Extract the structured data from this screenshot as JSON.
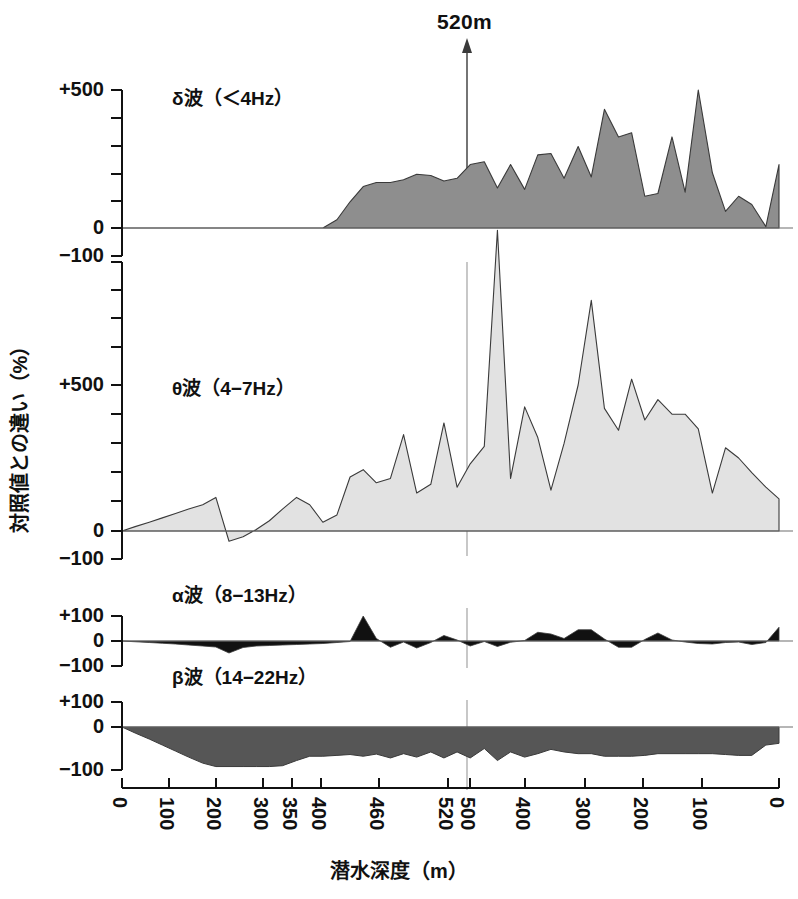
{
  "figure": {
    "depth_marker": {
      "label": "520m",
      "icon": "up-arrow-icon",
      "x_value": 520
    },
    "x_axis_title": "潜水深度（m）",
    "y_axis_title": "対照値との違い（%）",
    "x_tick_labels": [
      "0",
      "100",
      "200",
      "300",
      "350",
      "400",
      "460",
      "520",
      "500",
      "400",
      "300",
      "200",
      "100",
      "0"
    ],
    "colors": {
      "delta_fill": "#8e8e8e",
      "theta_fill": "#e2e2e2",
      "alpha_fill": "#111111",
      "beta_fill": "#565656",
      "axis": "#6f6f6f",
      "stroke": "#3a3a3a"
    }
  },
  "chart_data": [
    {
      "type": "area",
      "name": "delta",
      "title": "δ波（＜4Hz）",
      "xlabel": "潜水深度（m）",
      "ylabel": "対照値との違い（%）",
      "ytick_labels": [
        "+500",
        "0"
      ],
      "ytick_values": [
        500,
        0
      ],
      "ylim": [
        0,
        560
      ],
      "grid": false,
      "x": [
        0,
        14,
        29,
        43,
        57,
        71,
        86,
        100,
        114,
        129,
        143,
        157,
        171,
        186,
        200,
        214,
        229,
        243,
        257,
        271,
        286,
        300,
        314,
        329,
        343,
        357,
        371,
        386,
        400,
        414,
        429,
        443,
        457,
        471,
        486,
        500,
        514,
        529,
        543,
        557,
        571,
        586,
        600,
        614,
        629,
        643,
        657,
        671,
        686,
        700
      ],
      "values": [
        0,
        0,
        0,
        0,
        0,
        0,
        0,
        0,
        0,
        0,
        0,
        0,
        0,
        0,
        0,
        0,
        30,
        95,
        150,
        165,
        165,
        175,
        195,
        190,
        170,
        180,
        230,
        240,
        145,
        230,
        140,
        265,
        270,
        180,
        295,
        185,
        430,
        330,
        345,
        115,
        125,
        330,
        130,
        500,
        200,
        60,
        115,
        85,
        5,
        230
      ]
    },
    {
      "type": "area",
      "name": "theta",
      "title": "θ波（4−7Hz）",
      "xlabel": "潜水深度（m）",
      "ylabel": "対照値との違い（%）",
      "ytick_labels": [
        "−100",
        "+500",
        "0",
        "−100"
      ],
      "ytick_values": [
        -100,
        500,
        0,
        -100
      ],
      "ylim": [
        -100,
        1080
      ],
      "grid": false,
      "x": [
        0,
        14,
        29,
        43,
        57,
        71,
        86,
        100,
        114,
        129,
        143,
        157,
        171,
        186,
        200,
        214,
        229,
        243,
        257,
        271,
        286,
        300,
        314,
        329,
        343,
        357,
        371,
        386,
        400,
        414,
        429,
        443,
        457,
        471,
        486,
        500,
        514,
        529,
        543,
        557,
        571,
        586,
        600,
        614,
        629,
        643,
        657,
        671,
        686,
        700
      ],
      "values": [
        0,
        15,
        30,
        45,
        60,
        75,
        90,
        115,
        -35,
        -20,
        5,
        35,
        75,
        115,
        90,
        30,
        55,
        185,
        210,
        165,
        180,
        330,
        130,
        160,
        370,
        150,
        230,
        290,
        1030,
        180,
        425,
        320,
        140,
        300,
        500,
        790,
        420,
        345,
        520,
        380,
        450,
        400,
        400,
        350,
        130,
        285,
        250,
        200,
        150,
        110
      ]
    },
    {
      "type": "area",
      "name": "alpha",
      "title": "α波（8−13Hz）",
      "xlabel": "潜水深度（m）",
      "ylabel": "対照値との違い（%）",
      "ytick_labels": [
        "+100",
        "0",
        "−100"
      ],
      "ytick_values": [
        100,
        0,
        -100
      ],
      "ylim": [
        -100,
        100
      ],
      "grid": false,
      "x": [
        0,
        14,
        29,
        43,
        57,
        71,
        86,
        100,
        114,
        129,
        143,
        157,
        171,
        186,
        200,
        214,
        229,
        243,
        257,
        271,
        286,
        300,
        314,
        329,
        343,
        357,
        371,
        386,
        400,
        414,
        429,
        443,
        457,
        471,
        486,
        500,
        514,
        529,
        543,
        557,
        571,
        586,
        600,
        614,
        629,
        643,
        657,
        671,
        686,
        700
      ],
      "values": [
        0,
        -3,
        -6,
        -9,
        -12,
        -16,
        -20,
        -24,
        -48,
        -26,
        -20,
        -18,
        -16,
        -14,
        -12,
        -10,
        -6,
        -2,
        100,
        10,
        -25,
        -4,
        -28,
        -6,
        22,
        4,
        -20,
        -2,
        -22,
        -5,
        2,
        35,
        28,
        10,
        45,
        45,
        8,
        -25,
        -25,
        6,
        32,
        4,
        -4,
        -10,
        -12,
        -6,
        -4,
        -14,
        -6,
        55
      ]
    },
    {
      "type": "area",
      "name": "beta",
      "title": "β波（14−22Hz）",
      "xlabel": "潜水深度（m）",
      "ylabel": "対照値との違い（%）",
      "ytick_labels": [
        "+100",
        "0",
        "−100"
      ],
      "ytick_values": [
        100,
        0,
        -100
      ],
      "ylim": [
        -100,
        100
      ],
      "grid": false,
      "x": [
        0,
        14,
        29,
        43,
        57,
        71,
        86,
        100,
        114,
        129,
        143,
        157,
        171,
        186,
        200,
        214,
        229,
        243,
        257,
        271,
        286,
        300,
        314,
        329,
        343,
        357,
        371,
        386,
        400,
        414,
        429,
        443,
        457,
        471,
        486,
        500,
        514,
        529,
        543,
        557,
        571,
        586,
        600,
        614,
        629,
        643,
        657,
        671,
        686,
        700
      ],
      "values": [
        0,
        -14,
        -28,
        -42,
        -56,
        -70,
        -84,
        -92,
        -92,
        -92,
        -92,
        -92,
        -90,
        -78,
        -68,
        -68,
        -66,
        -64,
        -68,
        -63,
        -72,
        -62,
        -70,
        -58,
        -72,
        -58,
        -72,
        -50,
        -78,
        -58,
        -70,
        -62,
        -52,
        -58,
        -62,
        -62,
        -68,
        -68,
        -68,
        -66,
        -62,
        -62,
        -62,
        -62,
        -62,
        -64,
        -66,
        -66,
        -42,
        -38
      ]
    }
  ]
}
